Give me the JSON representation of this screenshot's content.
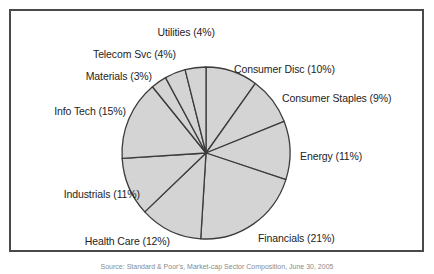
{
  "figure": {
    "frame_border_color": "#4a4a4a",
    "background_color": "#ffffff"
  },
  "caption": {
    "text": "Source: Standard & Poor's, Market-cap Sector Composition, June 30, 2005"
  },
  "chart_data": {
    "type": "pie",
    "title": "",
    "legend_position": "none",
    "labels_inline": true,
    "slice_fill_color": "#d4d4d4",
    "slice_border_color": "#3c3c3c",
    "start_angle_deg": 0,
    "direction": "clockwise",
    "categories": [
      "Consumer Disc",
      "Consumer Staples",
      "Energy",
      "Financials",
      "Health Care",
      "Industrials",
      "Info Tech",
      "Materials",
      "Telecom Svc",
      "Utilities"
    ],
    "values": [
      10,
      9,
      11,
      21,
      12,
      11,
      15,
      3,
      4,
      4
    ],
    "unit": "%",
    "total": 100,
    "slices": [
      {
        "name": "Consumer Disc",
        "value": 10,
        "label": "Consumer Disc (10%)",
        "side": "right",
        "x": 234,
        "y": 63,
        "anchor": "left"
      },
      {
        "name": "Consumer Staples",
        "value": 9,
        "label": "Consumer Staples (9%)",
        "side": "right",
        "x": 282,
        "y": 92,
        "anchor": "left"
      },
      {
        "name": "Energy",
        "value": 11,
        "label": "Energy (11%)",
        "side": "right",
        "x": 300,
        "y": 150,
        "anchor": "left"
      },
      {
        "name": "Financials",
        "value": 21,
        "label": "Financials (21%)",
        "side": "right",
        "x": 258,
        "y": 232,
        "anchor": "left"
      },
      {
        "name": "Health Care",
        "value": 12,
        "label": "Health Care (12%)",
        "side": "left",
        "x": 170,
        "y": 235,
        "anchor": "right"
      },
      {
        "name": "Industrials",
        "value": 11,
        "label": "Industrials (11%)",
        "side": "left",
        "x": 140,
        "y": 188,
        "anchor": "right"
      },
      {
        "name": "Info Tech",
        "value": 15,
        "label": "Info Tech (15%)",
        "side": "left",
        "x": 126,
        "y": 105,
        "anchor": "right"
      },
      {
        "name": "Materials",
        "value": 3,
        "label": "Materials (3%)",
        "side": "left",
        "x": 152,
        "y": 70,
        "anchor": "right"
      },
      {
        "name": "Telecom Svc",
        "value": 4,
        "label": "Telecom Svc (4%)",
        "side": "left",
        "x": 176,
        "y": 48,
        "anchor": "right"
      },
      {
        "name": "Utilities",
        "value": 4,
        "label": "Utilities (4%)",
        "side": "left",
        "x": 215,
        "y": 26,
        "anchor": "right"
      }
    ],
    "geometry": {
      "center_x": 206,
      "center_y": 153,
      "radius_x": 84,
      "radius_y": 86
    }
  }
}
